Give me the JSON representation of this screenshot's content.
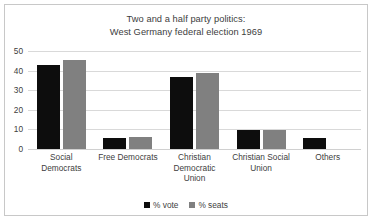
{
  "chart_data": {
    "type": "bar",
    "title": "Two and a half party politics: West Germany federal election 1969",
    "title_lines": [
      "Two and a half party politics:",
      "West Germany federal election 1969"
    ],
    "categories": [
      "Social Democrats",
      "Free Democrats",
      "Christian Democratic Union",
      "Christian Social Union",
      "Others"
    ],
    "category_label_lines": [
      [
        "Social Democrats"
      ],
      [
        "Free Democrats"
      ],
      [
        "Christian",
        "Democratic",
        "Union"
      ],
      [
        "Christian Social",
        "Union"
      ],
      [
        "Others"
      ]
    ],
    "series": [
      {
        "name": "% vote",
        "color": "#0d0d0d",
        "values": [
          42.7,
          5.8,
          36.6,
          9.5,
          5.4
        ]
      },
      {
        "name": "% seats",
        "color": "#808080",
        "values": [
          45.2,
          6.1,
          38.8,
          9.9,
          0
        ]
      }
    ],
    "xlabel": "",
    "ylabel": "",
    "ylim": [
      0,
      50
    ],
    "yticks": [
      50,
      40,
      30,
      20,
      10,
      0
    ],
    "grid": true,
    "legend_position": "bottom"
  }
}
